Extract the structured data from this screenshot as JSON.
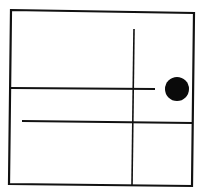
{
  "diagram": {
    "type": "maze-grid",
    "background": "#ffffff",
    "stroke_color": "#111111",
    "fill_color": "#0a0a0a",
    "outer_box": {
      "points": [
        [
          11,
          10
        ],
        [
          194,
          13
        ],
        [
          192,
          186
        ],
        [
          9,
          184
        ]
      ]
    },
    "lines": [
      {
        "name": "vertical-divider",
        "x1": 134,
        "y1": 29,
        "x2": 132,
        "y2": 185
      },
      {
        "name": "upper-horizontal-wall",
        "x1": 11,
        "y1": 88,
        "x2": 155,
        "y2": 89
      },
      {
        "name": "lower-horizontal-wall",
        "x1": 22,
        "y1": 121,
        "x2": 193,
        "y2": 123
      }
    ],
    "dot": {
      "cx": 177,
      "cy": 89,
      "r": 12
    }
  }
}
